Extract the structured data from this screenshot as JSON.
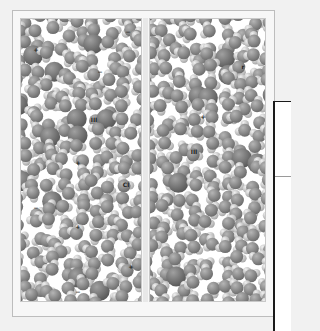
{
  "figure": {
    "palette": {
      "background": "#f1f1f1",
      "panel_bg": "#ffffff",
      "oxygen_dark": "#6e6e6e",
      "oxygen_mid": "#8c8c8c",
      "hydrogen_light": "#c9c9c9",
      "ion_dark": "#5a5a5a",
      "callout_border": "#1a1a1a"
    },
    "left_panel": {
      "ion_labels": [
        {
          "text": "+",
          "x": 36,
          "y": 50
        },
        {
          "text": "−",
          "x": 128,
          "y": 32
        },
        {
          "text": "−",
          "x": 100,
          "y": 72
        },
        {
          "text": "III",
          "x": 94,
          "y": 120
        },
        {
          "text": "+",
          "x": 78,
          "y": 163
        },
        {
          "text": "Cl",
          "x": 126,
          "y": 185
        },
        {
          "text": "−",
          "x": 36,
          "y": 208
        },
        {
          "text": "+",
          "x": 78,
          "y": 227
        },
        {
          "text": "+",
          "x": 131,
          "y": 267
        },
        {
          "text": "−",
          "x": 78,
          "y": 292
        }
      ]
    },
    "right_panel": {
      "ion_labels": [
        {
          "text": "r",
          "x": 243,
          "y": 67
        },
        {
          "text": "+",
          "x": 203,
          "y": 117
        },
        {
          "text": "III",
          "x": 194,
          "y": 152
        }
      ]
    }
  }
}
